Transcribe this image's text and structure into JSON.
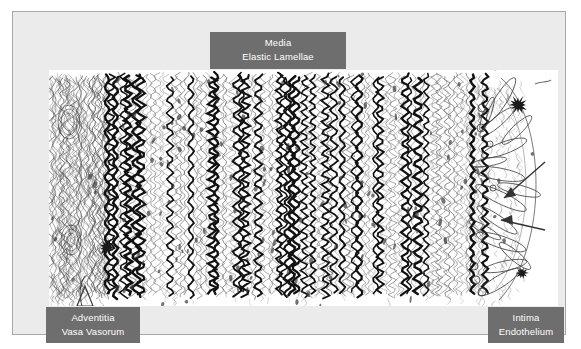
{
  "figure": {
    "panel_background": "#ebebeb",
    "panel_border": "#a8a8a8",
    "canvas_background": "#ffffff",
    "ink_color": "#1a1a1a",
    "callout_background": "#6e6e6e",
    "callout_text_color": "#ffffff"
  },
  "callouts": {
    "media": {
      "primary": "Media",
      "secondary": "Elastic Lamellae"
    },
    "adventitia": {
      "primary": "Adventitia",
      "secondary": "Vasa Vasorum"
    },
    "intima": {
      "primary": "Intima",
      "secondary": "Endothelium"
    }
  },
  "layers": [
    {
      "name": "adventitia",
      "label": "Adventitia",
      "sublabel": "Vasa Vasorum",
      "description": "Outer fibrous connective tissue layer with small nourishing vessels",
      "position": "left"
    },
    {
      "name": "media",
      "label": "Media",
      "sublabel": "Elastic Lamellae",
      "description": "Thick middle layer of densely packed wavy elastic lamellae",
      "position": "center"
    },
    {
      "name": "intima",
      "label": "Intima",
      "sublabel": "Endothelium",
      "description": "Inner lining of endothelial cells facing the lumen",
      "position": "right"
    }
  ]
}
